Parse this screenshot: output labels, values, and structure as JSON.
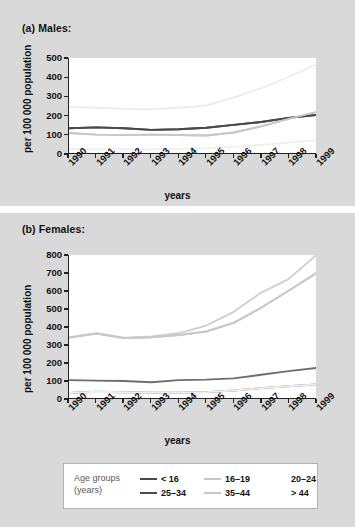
{
  "panel_a": {
    "title": "(a) Males:",
    "ylabel": "per 100 000 population",
    "xlabel": "years"
  },
  "panel_b": {
    "title": "(b) Females:",
    "ylabel": "per 100 000 population",
    "xlabel": "years"
  },
  "legend": {
    "title_line1": "Age groups",
    "title_line2": "(years)",
    "entries": [
      {
        "label": "< 16",
        "color": "#4a4a4a",
        "swatch": true
      },
      {
        "label": "25–34",
        "color": "#4a4a4a",
        "swatch": true
      },
      {
        "label": "16–19",
        "color": "#c8c8c8",
        "swatch": true
      },
      {
        "label": "35–44",
        "color": "#c8c8c8",
        "swatch": true
      },
      {
        "label": "20–24",
        "color": "#f2f2f2",
        "swatch": false
      },
      {
        "label": "> 44",
        "color": "#f2f2f2",
        "swatch": false
      }
    ]
  },
  "chart_data": [
    {
      "type": "line",
      "title": "(a) Males:",
      "xlabel": "years",
      "ylabel": "per 100 000 population",
      "x": [
        1990,
        1991,
        1992,
        1993,
        1994,
        1995,
        1996,
        1997,
        1998,
        1999
      ],
      "xtick_labels": [
        "1990",
        "1991",
        "1992",
        "1993",
        "1994",
        "1995",
        "1996",
        "1997",
        "1998",
        "1999"
      ],
      "ytick_labels": [
        "0",
        "100",
        "200",
        "300",
        "400",
        "500"
      ],
      "ylim": [
        0,
        500
      ],
      "xlim": [
        1990,
        1999
      ],
      "grid": false,
      "legend_position": "below-figure",
      "series": [
        {
          "name": "< 16",
          "color": "#4a4a4a",
          "values": [
            130,
            135,
            130,
            122,
            125,
            133,
            148,
            163,
            185,
            200
          ]
        },
        {
          "name": "16–19",
          "color": "#c8c8c8",
          "values": [
            105,
            97,
            95,
            97,
            95,
            92,
            108,
            140,
            180,
            215
          ]
        },
        {
          "name": "20–24",
          "color": "#ededed",
          "values": [
            243,
            238,
            232,
            230,
            238,
            250,
            292,
            340,
            400,
            465
          ]
        },
        {
          "name": "25–34",
          "color": "#4a4a4a",
          "values": [
            130,
            135,
            130,
            122,
            125,
            133,
            148,
            163,
            185,
            200
          ]
        },
        {
          "name": "35–44",
          "color": "#c8c8c8",
          "values": [
            105,
            97,
            95,
            97,
            95,
            92,
            108,
            140,
            180,
            215
          ]
        },
        {
          "name": "> 44",
          "color": "#f0f0f0",
          "values": [
            20,
            20,
            20,
            20,
            22,
            25,
            32,
            42,
            55,
            68
          ]
        }
      ]
    },
    {
      "type": "line",
      "title": "(b) Females:",
      "xlabel": "years",
      "ylabel": "per 100 000 population",
      "x": [
        1990,
        1991,
        1992,
        1993,
        1994,
        1995,
        1996,
        1997,
        1998,
        1999
      ],
      "xtick_labels": [
        "1990",
        "1991",
        "1992",
        "1993",
        "1994",
        "1995",
        "1996",
        "1997",
        "1998",
        "1999"
      ],
      "ytick_labels": [
        "0",
        "100",
        "200",
        "300",
        "400",
        "500",
        "600",
        "700",
        "800"
      ],
      "ylim": [
        0,
        800
      ],
      "xlim": [
        1990,
        1999
      ],
      "grid": false,
      "legend_position": "below-figure",
      "series": [
        {
          "name": "< 16",
          "color": "#6e6e6e",
          "values": [
            100,
            97,
            95,
            88,
            100,
            103,
            110,
            130,
            150,
            168
          ]
        },
        {
          "name": "16–19",
          "color": "#c8c8c8",
          "values": [
            338,
            360,
            335,
            340,
            352,
            372,
            420,
            505,
            600,
            697
          ]
        },
        {
          "name": "20–24",
          "color": "#cfcfcf",
          "values": [
            340,
            362,
            338,
            345,
            362,
            405,
            482,
            590,
            665,
            798
          ]
        },
        {
          "name": "25–34",
          "color": "#6e6e6e",
          "values": [
            28,
            35,
            32,
            30,
            30,
            33,
            42,
            55,
            66,
            76
          ]
        },
        {
          "name": "35–44",
          "color": "#c8c8c8",
          "values": [
            338,
            360,
            335,
            340,
            352,
            372,
            420,
            505,
            600,
            697
          ]
        },
        {
          "name": "> 44",
          "color": "#efefef",
          "values": [
            28,
            35,
            32,
            30,
            30,
            33,
            42,
            55,
            66,
            76
          ]
        }
      ]
    }
  ]
}
